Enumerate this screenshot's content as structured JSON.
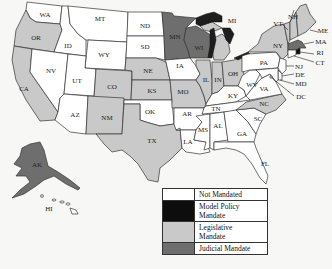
{
  "map": {
    "type": "choropleth",
    "region": "United States",
    "colors": {
      "not_mandated": "#ffffff",
      "model_policy_mandate": "#0d0d0d",
      "legislative_mandate": "#c9c9c9",
      "judicial_mandate": "#6e6e6e",
      "border": "#333333"
    },
    "states": [
      {
        "abbr": "WA",
        "category": "not_mandated"
      },
      {
        "abbr": "OR",
        "category": "legislative_mandate"
      },
      {
        "abbr": "CA",
        "category": "legislative_mandate"
      },
      {
        "abbr": "ID",
        "category": "not_mandated"
      },
      {
        "abbr": "NV",
        "category": "not_mandated"
      },
      {
        "abbr": "MT",
        "category": "not_mandated"
      },
      {
        "abbr": "WY",
        "category": "not_mandated"
      },
      {
        "abbr": "UT",
        "category": "not_mandated"
      },
      {
        "abbr": "AZ",
        "category": "not_mandated"
      },
      {
        "abbr": "CO",
        "category": "legislative_mandate"
      },
      {
        "abbr": "NM",
        "category": "legislative_mandate"
      },
      {
        "abbr": "ND",
        "category": "not_mandated"
      },
      {
        "abbr": "SD",
        "category": "not_mandated"
      },
      {
        "abbr": "NE",
        "category": "legislative_mandate"
      },
      {
        "abbr": "KS",
        "category": "legislative_mandate"
      },
      {
        "abbr": "OK",
        "category": "not_mandated"
      },
      {
        "abbr": "TX",
        "category": "legislative_mandate"
      },
      {
        "abbr": "MN",
        "category": "judicial_mandate"
      },
      {
        "abbr": "IA",
        "category": "not_mandated"
      },
      {
        "abbr": "MO",
        "category": "legislative_mandate"
      },
      {
        "abbr": "AR",
        "category": "not_mandated"
      },
      {
        "abbr": "LA",
        "category": "not_mandated"
      },
      {
        "abbr": "WI",
        "category": "judicial_mandate"
      },
      {
        "abbr": "IL",
        "category": "legislative_mandate"
      },
      {
        "abbr": "MI",
        "category": "legislative_mandate"
      },
      {
        "abbr": "IN",
        "category": "legislative_mandate"
      },
      {
        "abbr": "OH",
        "category": "legislative_mandate"
      },
      {
        "abbr": "KY",
        "category": "not_mandated"
      },
      {
        "abbr": "TN",
        "category": "not_mandated"
      },
      {
        "abbr": "MS",
        "category": "not_mandated"
      },
      {
        "abbr": "AL",
        "category": "not_mandated"
      },
      {
        "abbr": "GA",
        "category": "not_mandated"
      },
      {
        "abbr": "FL",
        "category": "not_mandated"
      },
      {
        "abbr": "SC",
        "category": "not_mandated"
      },
      {
        "abbr": "NC",
        "category": "legislative_mandate"
      },
      {
        "abbr": "VA",
        "category": "not_mandated"
      },
      {
        "abbr": "WV",
        "category": "not_mandated"
      },
      {
        "abbr": "PA",
        "category": "not_mandated"
      },
      {
        "abbr": "NY",
        "category": "legislative_mandate"
      },
      {
        "abbr": "VT",
        "category": "legislative_mandate"
      },
      {
        "abbr": "NH",
        "category": "legislative_mandate"
      },
      {
        "abbr": "ME",
        "category": "legislative_mandate"
      },
      {
        "abbr": "MA",
        "category": "judicial_mandate"
      },
      {
        "abbr": "RI",
        "category": "model_policy_mandate"
      },
      {
        "abbr": "CT",
        "category": "not_mandated"
      },
      {
        "abbr": "NJ",
        "category": "not_mandated"
      },
      {
        "abbr": "DE",
        "category": "not_mandated"
      },
      {
        "abbr": "MD",
        "category": "not_mandated"
      },
      {
        "abbr": "DC",
        "category": "not_mandated"
      },
      {
        "abbr": "AK",
        "category": "judicial_mandate"
      },
      {
        "abbr": "HI",
        "category": "not_mandated"
      }
    ],
    "labels": {
      "WA": "WA",
      "OR": "OR",
      "CA": "CA",
      "ID": "ID",
      "NV": "NV",
      "MT": "MT",
      "WY": "WY",
      "UT": "UT",
      "AZ": "AZ",
      "CO": "CO",
      "NM": "NM",
      "ND": "ND",
      "SD": "SD",
      "NE": "NE",
      "KS": "KS",
      "OK": "OK",
      "TX": "TX",
      "MN": "MN",
      "IA": "IA",
      "MO": "MO",
      "AR": "AR",
      "LA": "LA",
      "WI": "WI",
      "IL": "IL",
      "MI": "MI",
      "IN": "IN",
      "OH": "OH",
      "KY": "KY",
      "TN": "TN",
      "MS": "MS",
      "AL": "AL",
      "GA": "GA",
      "FL": "FL",
      "SC": "SC",
      "NC": "NC",
      "VA": "VA",
      "WV": "WV",
      "PA": "PA",
      "NY": "NY",
      "VT": "VT",
      "NH": "NH",
      "ME": "ME",
      "MA": "MA",
      "RI": "RI",
      "CT": "CT",
      "NJ": "NJ",
      "DE": "DE",
      "MD": "MD",
      "DC": "DC",
      "AK": "AK",
      "HI": "HI"
    }
  },
  "legend": {
    "items": [
      {
        "label": "Not Mandated",
        "color": "#ffffff"
      },
      {
        "label": "Model Policy Mandate",
        "color": "#0d0d0d"
      },
      {
        "label": "Legislative Mandate",
        "color": "#c9c9c9"
      },
      {
        "label": "Judicial Mandate",
        "color": "#6e6e6e"
      }
    ]
  }
}
